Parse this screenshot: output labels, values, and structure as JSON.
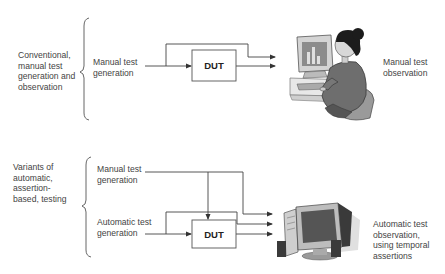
{
  "top_section": {
    "category_label": "Conventional,\nmanual test\ngeneration and\nobservation",
    "input_label": "Manual test\ngeneration",
    "dut_label": "DUT",
    "output_label": "Manual test\nobservation",
    "observer_icon": "person-at-computer-icon"
  },
  "bottom_section": {
    "category_label": "Variants of\nautomatic,\nassertion-\nbased, testing",
    "manual_input_label": "Manual test\ngeneration",
    "auto_input_label": "Automatic test\ngeneration",
    "dut_label": "DUT",
    "output_label": "Automatic test\nobservation,\nusing temporal\nassertions",
    "observer_icon": "desktop-computer-icon"
  },
  "colors": {
    "line": "#444444",
    "text": "#444444",
    "box_border": "#555555"
  }
}
